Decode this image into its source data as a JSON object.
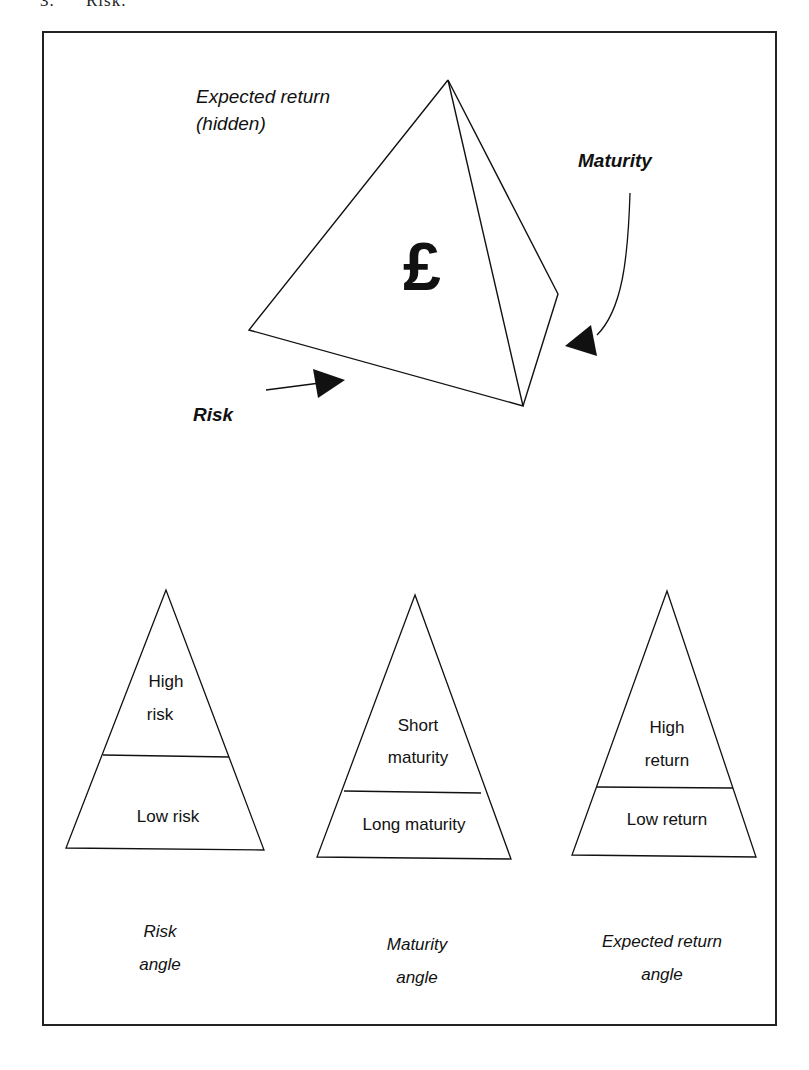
{
  "heading": {
    "number": "3.",
    "text": "Risk."
  },
  "tetrahedron": {
    "symbol": "£",
    "labels": {
      "expected_return_line1": "Expected return",
      "expected_return_line2": "(hidden)",
      "maturity": "Maturity",
      "risk": "Risk"
    }
  },
  "pyramids": [
    {
      "top_line1": "High",
      "top_line2": "risk",
      "bottom": "Low risk",
      "caption_line1": "Risk",
      "caption_line2": "angle"
    },
    {
      "top_line1": "Short",
      "top_line2": "maturity",
      "bottom": "Long maturity",
      "caption_line1": "Maturity",
      "caption_line2": "angle"
    },
    {
      "top_line1": "High",
      "top_line2": "return",
      "bottom": "Low return",
      "caption_line1": "Expected return",
      "caption_line2": "angle"
    }
  ]
}
